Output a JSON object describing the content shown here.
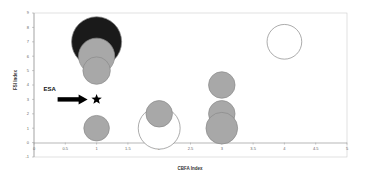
{
  "chart_data": {
    "type": "scatter",
    "subtype": "bubble",
    "title": "",
    "xlabel": "CBFA Index",
    "ylabel": "FSI Index",
    "xlim": [
      0,
      5
    ],
    "ylim": [
      -1,
      9
    ],
    "xticks": [
      "0",
      "0.5",
      "1",
      "1.5",
      "2",
      "2.5",
      "3",
      "3.5",
      "4",
      "4.5",
      "5"
    ],
    "xtick_values": [
      0,
      0.5,
      1,
      1.5,
      2,
      2.5,
      3,
      3.5,
      4,
      4.5,
      5
    ],
    "yticks": [
      "-1",
      "0",
      "1",
      "2",
      "3",
      "4",
      "5",
      "6",
      "7",
      "8",
      "9"
    ],
    "ytick_values": [
      -1,
      0,
      1,
      2,
      3,
      4,
      5,
      6,
      7,
      8,
      9
    ],
    "grid": false,
    "series": [
      {
        "name": "bubbles",
        "points": [
          {
            "x": 1,
            "y": 7,
            "size": 5,
            "fill": "#1a1a1a"
          },
          {
            "x": 1,
            "y": 6,
            "size": 2.6,
            "fill": "#a8a8a8"
          },
          {
            "x": 1,
            "y": 5,
            "size": 1.5,
            "fill": "#a8a8a8"
          },
          {
            "x": 1,
            "y": 1,
            "size": 1.3,
            "fill": "#a8a8a8"
          },
          {
            "x": 2,
            "y": 1,
            "size": 3.5,
            "fill": "#ffffff"
          },
          {
            "x": 2,
            "y": 2,
            "size": 1.4,
            "fill": "#a8a8a8"
          },
          {
            "x": 3,
            "y": 4,
            "size": 1.4,
            "fill": "#a8a8a8"
          },
          {
            "x": 3,
            "y": 2,
            "size": 1.4,
            "fill": "#a8a8a8"
          },
          {
            "x": 3,
            "y": 1,
            "size": 2.0,
            "fill": "#a8a8a8"
          },
          {
            "x": 4,
            "y": 7,
            "size": 2.4,
            "fill": "#ffffff"
          }
        ]
      }
    ],
    "annotations": [
      {
        "type": "star",
        "label": "ESA",
        "x": 1,
        "y": 3,
        "arrow": true
      }
    ],
    "colors": {
      "dark": "#1a1a1a",
      "gray": "#a8a8a8",
      "open": "#ffffff",
      "outline": "#888888"
    }
  }
}
